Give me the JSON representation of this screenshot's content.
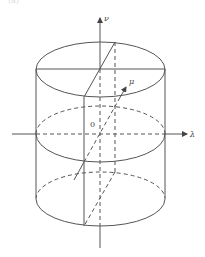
{
  "figure": {
    "axes": {
      "horizontal_label": "λ",
      "vertical_label": "ν",
      "depth_label": "μ",
      "origin_label": "0"
    },
    "top_fragment_text": "(a)",
    "stroke_color": "#555555",
    "background": "#ffffff"
  }
}
